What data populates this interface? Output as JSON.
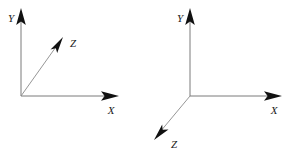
{
  "figure": {
    "background_color": "#ffffff",
    "line_color": "#7a7a7a",
    "arrow_color": "#111111",
    "label_color": "#1a1a1a"
  },
  "diagrams": [
    {
      "name": "left-coordinate-system",
      "description": "Right-handed axes with Z pointing up-right toward the viewer",
      "origin": {
        "x": 21,
        "y": 96
      },
      "axes": [
        {
          "id": "y",
          "label": "Y",
          "label_x": 11,
          "label_y": 21,
          "tail_x": 21,
          "tail_y": 96,
          "tip_x": 21,
          "tip_y": 9,
          "direction": "up"
        },
        {
          "id": "z",
          "label": "Z",
          "label_x": 73,
          "label_y": 47,
          "tail_x": 21,
          "tail_y": 96,
          "tip_x": 60,
          "tip_y": 40,
          "direction": "up-right"
        },
        {
          "id": "x",
          "label": "X",
          "label_x": 111,
          "label_y": 113,
          "tail_x": 21,
          "tail_y": 96,
          "tip_x": 118,
          "tip_y": 96,
          "direction": "right"
        }
      ]
    },
    {
      "name": "right-coordinate-system",
      "description": "Left-handed axes with Z pointing down-left away from the viewer",
      "origin": {
        "x": 190,
        "y": 96
      },
      "axes": [
        {
          "id": "y",
          "label": "Y",
          "label_x": 179,
          "label_y": 21,
          "tail_x": 190,
          "tail_y": 96,
          "tip_x": 190,
          "tip_y": 9,
          "direction": "up"
        },
        {
          "id": "x",
          "label": "X",
          "label_x": 274,
          "label_y": 113,
          "tail_x": 190,
          "tail_y": 96,
          "tip_x": 281,
          "tip_y": 96,
          "direction": "right"
        },
        {
          "id": "z",
          "label": "Z",
          "label_x": 73,
          "label_y": 148,
          "tail_x": 190,
          "tail_y": 96,
          "tip_x": 155,
          "tip_y": 139,
          "direction": "down-left"
        }
      ]
    }
  ],
  "labels": {
    "left_y": "Y",
    "left_z": "Z",
    "left_x": "X",
    "right_y": "Y",
    "right_x": "X",
    "right_z": "Z"
  }
}
